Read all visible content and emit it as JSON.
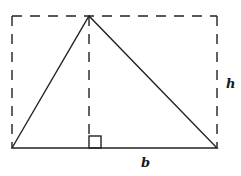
{
  "diagram": {
    "labels": {
      "height": "h",
      "base": "b"
    },
    "shapes": [
      {
        "name": "triangle",
        "style": "solid"
      },
      {
        "name": "bounding-rectangle",
        "style": "dashed"
      },
      {
        "name": "altitude",
        "style": "dashed"
      },
      {
        "name": "right-angle-marker",
        "style": "solid"
      }
    ],
    "colors": {
      "stroke": "#222222",
      "background": "#ffffff"
    }
  }
}
